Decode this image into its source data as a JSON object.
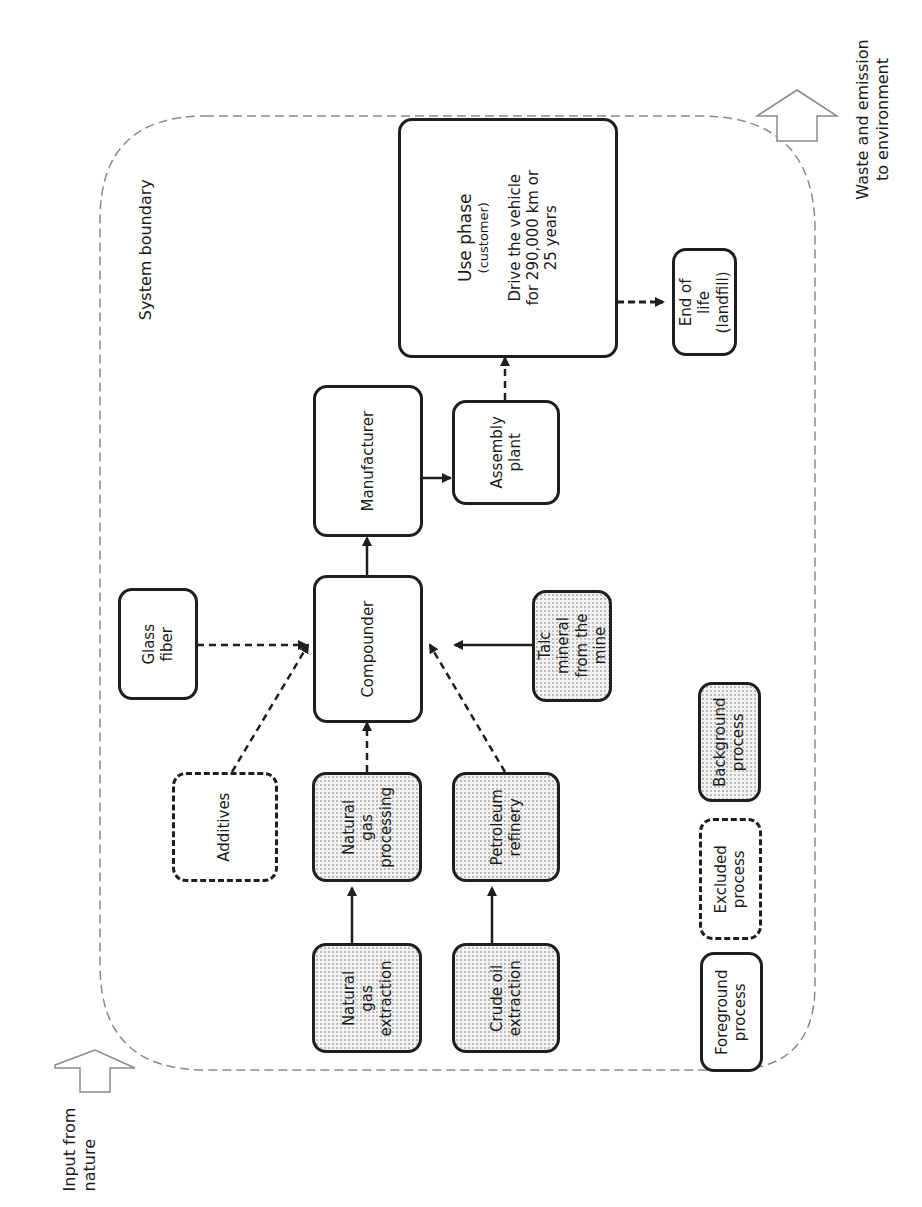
{
  "labels": {
    "system_boundary": "System boundary",
    "input_from_nature_1": "Input from",
    "input_from_nature_2": "nature",
    "waste_1": "Waste and emission",
    "waste_2": "to environment"
  },
  "nodes": {
    "use_phase": {
      "title": "Use phase",
      "sub": "(customer)",
      "line1": "Drive the vehicle",
      "line2": "for 290,000 km or",
      "line3": "25 years",
      "type": "foreground"
    },
    "end_of_life": {
      "line1": "End of",
      "line2": "life",
      "line3": "(landfill)",
      "type": "foreground"
    },
    "manufacturer": {
      "line1": "Manufacturer",
      "type": "foreground"
    },
    "assembly_plant": {
      "line1": "Assembly",
      "line2": "plant",
      "type": "foreground"
    },
    "glass_fiber": {
      "line1": "Glass",
      "line2": "fiber",
      "type": "foreground"
    },
    "compounder": {
      "line1": "Compounder",
      "type": "foreground"
    },
    "talc": {
      "line1": "Talc",
      "line2": "mineral",
      "line3": "from the",
      "line4": "mine",
      "type": "background"
    },
    "additives": {
      "line1": "Additives",
      "type": "excluded"
    },
    "ng_processing": {
      "line1": "Natural",
      "line2": "gas",
      "line3": "processing",
      "type": "background"
    },
    "petroleum_refinery": {
      "line1": "Petroleum",
      "line2": "refinery",
      "type": "background"
    },
    "ng_extraction": {
      "line1": "Natural",
      "line2": "gas",
      "line3": "extraction",
      "type": "background"
    },
    "crude_oil_extraction": {
      "line1": "Crude oil",
      "line2": "extraction",
      "type": "background"
    }
  },
  "legend": {
    "background": {
      "line1": "Background",
      "line2": "process"
    },
    "excluded": {
      "line1": "Excluded",
      "line2": "process"
    },
    "foreground": {
      "line1": "Foreground",
      "line2": "process"
    }
  },
  "edges": [
    {
      "from": "ng_extraction",
      "to": "ng_processing",
      "style": "solid"
    },
    {
      "from": "crude_oil_extraction",
      "to": "petroleum_refinery",
      "style": "solid"
    },
    {
      "from": "ng_processing",
      "to": "compounder",
      "style": "dashed"
    },
    {
      "from": "petroleum_refinery",
      "to": "compounder",
      "style": "dashed"
    },
    {
      "from": "additives",
      "to": "compounder",
      "style": "dashed"
    },
    {
      "from": "glass_fiber",
      "to": "compounder",
      "style": "dashed"
    },
    {
      "from": "talc",
      "to": "compounder",
      "style": "solid"
    },
    {
      "from": "compounder",
      "to": "manufacturer",
      "style": "solid"
    },
    {
      "from": "manufacturer",
      "to": "assembly_plant",
      "style": "solid"
    },
    {
      "from": "assembly_plant",
      "to": "use_phase",
      "style": "dashed"
    },
    {
      "from": "use_phase",
      "to": "end_of_life",
      "style": "dashed"
    }
  ],
  "colors": {
    "stroke": "#1e1e1e",
    "boundary": "#8a8a8a",
    "background_fill": "#f3f3f3"
  }
}
